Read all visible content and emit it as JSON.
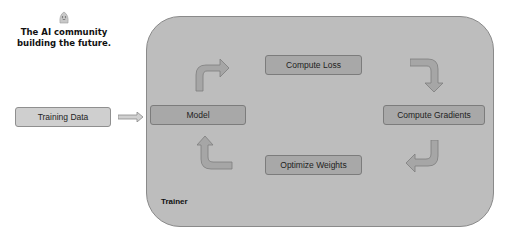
{
  "brand": {
    "icon": "hugging-face-icon",
    "tagline_line1": "The AI community",
    "tagline_line2": "building the future."
  },
  "diagram": {
    "input": {
      "label": "Training Data"
    },
    "container": {
      "label": "Trainer"
    },
    "nodes": {
      "model": "Model",
      "compute_loss": "Compute Loss",
      "compute_gradients": "Compute Gradients",
      "optimize_weights": "Optimize Weights"
    },
    "flow": [
      "Training Data -> Model",
      "Model -> Compute Loss",
      "Compute Loss -> Compute Gradients",
      "Compute Gradients -> Optimize Weights",
      "Optimize Weights -> Model"
    ],
    "colors": {
      "container_fill": "#bdbdbd",
      "node_dark": "#a8a8a8",
      "node_light": "#cfcfcf",
      "arrow_fill": "#a6a6a6"
    }
  }
}
